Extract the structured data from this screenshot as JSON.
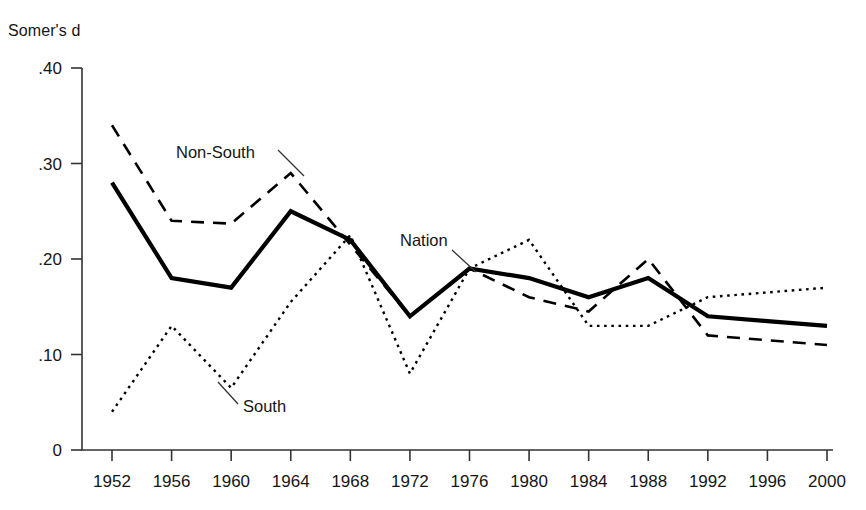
{
  "chart_data": {
    "type": "line",
    "title": "",
    "ylabel": "Somer's d",
    "xlabel": "",
    "grid": false,
    "legend_position": "inline-annotations",
    "x": [
      1952,
      1956,
      1960,
      1964,
      1968,
      1972,
      1976,
      1980,
      1984,
      1988,
      1992,
      1996,
      2000
    ],
    "xtick_labels": [
      "1952",
      "1956",
      "1960",
      "1964",
      "1968",
      "1972",
      "1976",
      "1980",
      "1984",
      "1988",
      "1992",
      "1996",
      "2000"
    ],
    "ytick_labels": [
      ".40",
      ".30",
      ".20",
      ".10",
      "0"
    ],
    "ytick_values": [
      0.4,
      0.3,
      0.2,
      0.1,
      0
    ],
    "ylim": [
      0,
      0.4
    ],
    "xlim": [
      1952,
      2000
    ],
    "series": [
      {
        "name": "Nation",
        "style": "solid",
        "color": "#000000",
        "values": [
          0.28,
          0.18,
          0.17,
          0.25,
          0.22,
          0.14,
          0.19,
          0.18,
          0.16,
          0.18,
          0.14,
          0.135,
          0.13
        ]
      },
      {
        "name": "Non-South",
        "style": "dashed",
        "color": "#000000",
        "values": [
          0.34,
          0.24,
          0.237,
          0.29,
          0.215,
          0.14,
          0.19,
          0.16,
          0.145,
          0.2,
          0.12,
          0.115,
          0.11
        ]
      },
      {
        "name": "South",
        "style": "dotted",
        "color": "#000000",
        "values": [
          0.04,
          0.13,
          0.065,
          0.155,
          0.225,
          0.08,
          0.19,
          0.22,
          0.13,
          0.13,
          0.16,
          0.165,
          0.17
        ]
      }
    ],
    "annotations": [
      {
        "text": "Non-South",
        "x": 176,
        "y": 158,
        "leader_from": [
          278,
          150
        ],
        "leader_to": [
          304,
          176
        ]
      },
      {
        "text": "Nation",
        "x": 400,
        "y": 246,
        "leader_from": [
          452,
          250
        ],
        "leader_to": [
          476,
          272
        ]
      },
      {
        "text": "South",
        "x": 243,
        "y": 412,
        "leader_from": [
          238,
          404
        ],
        "leader_to": [
          218,
          382
        ]
      }
    ]
  },
  "labels": {
    "y_axis_title": "Somer's d"
  }
}
